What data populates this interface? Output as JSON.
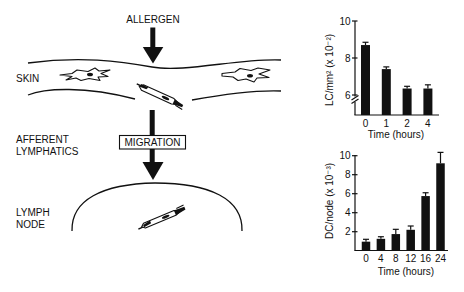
{
  "diagram": {
    "stimulus_label": "ALLERGEN",
    "tissue_labels": {
      "skin": "SKIN",
      "afferent_line1": "AFFERENT",
      "afferent_line2": "LYMPHATICS",
      "node_line1": "LYMPH",
      "node_line2": "NODE"
    },
    "process_box_label": "MIGRATION",
    "colors": {
      "ink": "#111111",
      "background": "#ffffff"
    }
  },
  "chart_data": [
    {
      "type": "bar",
      "title": "",
      "categories": [
        "0",
        "1",
        "2",
        "4"
      ],
      "values": [
        8.7,
        7.4,
        6.35,
        6.35
      ],
      "errors": [
        0.15,
        0.12,
        0.12,
        0.2
      ],
      "xlabel": "Time (hours)",
      "ylabel": "LC/mm² (x 10⁻²)",
      "yticks": [
        "6",
        "8",
        "10"
      ],
      "ylim": [
        5,
        10
      ],
      "axis_break": true,
      "grid": false,
      "legend": "none"
    },
    {
      "type": "bar",
      "title": "",
      "categories": [
        "0",
        "4",
        "8",
        "12",
        "16",
        "24"
      ],
      "values": [
        0.95,
        1.25,
        1.75,
        2.2,
        5.75,
        9.2
      ],
      "errors": [
        0.25,
        0.22,
        0.5,
        0.4,
        0.35,
        1.15
      ],
      "xlabel": "Time (hours)",
      "ylabel": "DC/node (x 10⁻³)",
      "yticks": [
        "2",
        "4",
        "6",
        "8",
        "10"
      ],
      "ylim": [
        0,
        10.5
      ],
      "axis_break": false,
      "grid": false,
      "legend": "none"
    }
  ]
}
